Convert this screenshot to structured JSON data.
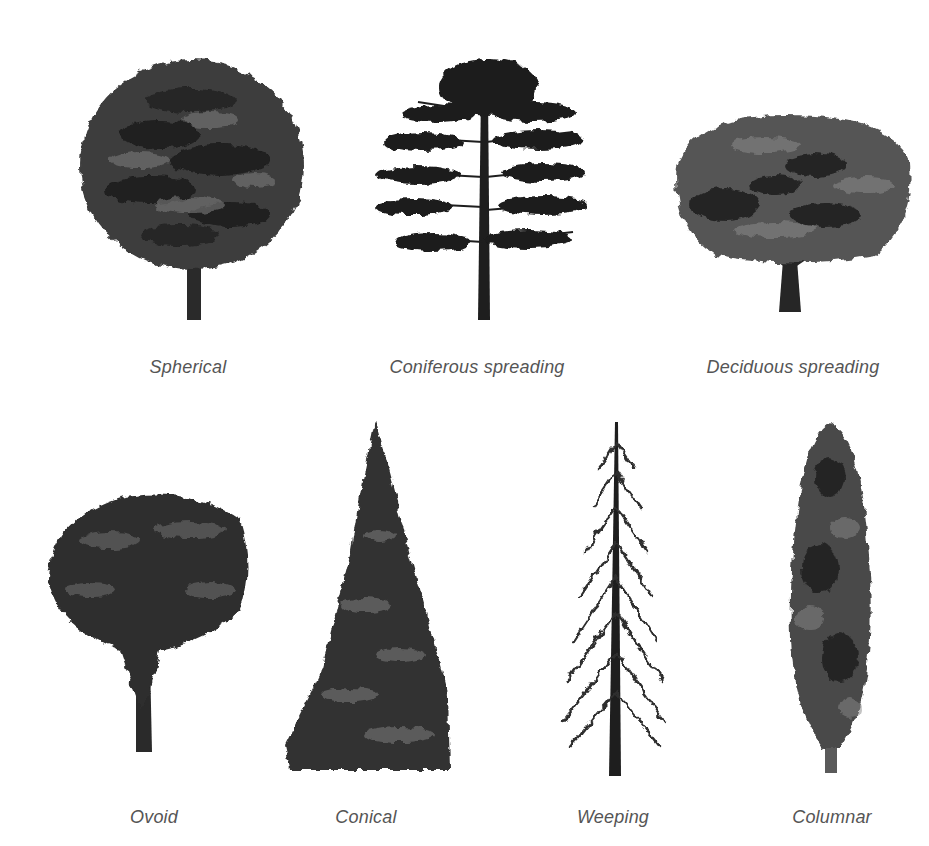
{
  "figure": {
    "rows": [
      {
        "items": [
          {
            "label": "Spherical",
            "icon": "spherical-tree-icon"
          },
          {
            "label": "Coniferous spreading",
            "icon": "coniferous-spreading-tree-icon"
          },
          {
            "label": "Deciduous spreading",
            "icon": "deciduous-spreading-tree-icon"
          }
        ]
      },
      {
        "items": [
          {
            "label": "Ovoid",
            "icon": "ovoid-tree-icon"
          },
          {
            "label": "Conical",
            "icon": "conical-tree-icon"
          },
          {
            "label": "Weeping",
            "icon": "weeping-tree-icon"
          },
          {
            "label": "Columnar",
            "icon": "columnar-tree-icon"
          }
        ]
      }
    ]
  },
  "colors": {
    "foliage_dark": "#1e1e1e",
    "foliage_mid": "#4a4a4a",
    "foliage_light": "#7a7a7a",
    "label_text": "#555555",
    "background": "#ffffff"
  }
}
